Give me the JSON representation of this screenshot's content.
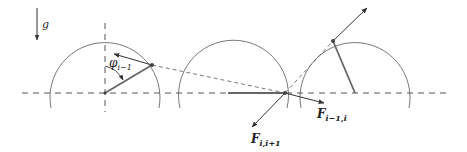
{
  "diagram": {
    "gravity_label": "g",
    "angle_label_main": "φ",
    "angle_label_sub": "i−1",
    "force_label_1_main": "F",
    "force_label_1_sub": "i,i+1",
    "force_label_2_main": "F",
    "force_label_2_sub": "i−1,i",
    "colors": {
      "stroke": "#555555",
      "rod": "#666666",
      "arrow": "#333333",
      "background": "#ffffff"
    },
    "pendulums": [
      {
        "center": [
          105,
          93
        ],
        "radius": 55,
        "bob": [
          152,
          65
        ]
      },
      {
        "center": [
          233,
          93
        ],
        "radius": 55,
        "bob": [
          285,
          93
        ]
      },
      {
        "center": [
          355,
          93
        ],
        "radius": 55,
        "bob": [
          333,
          41
        ]
      }
    ]
  }
}
